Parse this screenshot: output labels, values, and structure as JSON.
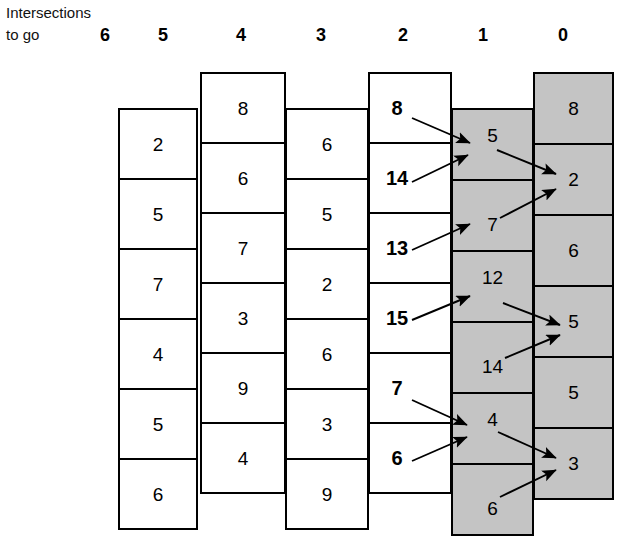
{
  "header": {
    "line1": "Intersections",
    "line2": "to go",
    "columns": [
      {
        "label": "6",
        "x": 92
      },
      {
        "label": "5",
        "x": 150
      },
      {
        "label": "4",
        "x": 228
      },
      {
        "label": "3",
        "x": 308
      },
      {
        "label": "2",
        "x": 390
      },
      {
        "label": "1",
        "x": 470
      },
      {
        "label": "0",
        "x": 550
      }
    ]
  },
  "diagram": {
    "gray": "#c4c4c4",
    "stroke": "#000000",
    "columns": [
      {
        "name": "column-5",
        "left": 118,
        "width": 80,
        "top": 108,
        "cell_height": 70,
        "shaded": false,
        "bold": false,
        "values": [
          "2",
          "5",
          "7",
          "4",
          "5",
          "6"
        ]
      },
      {
        "name": "column-4",
        "left": 200,
        "width": 86,
        "top": 72,
        "cell_height": 70,
        "shaded": false,
        "bold": false,
        "values": [
          "8",
          "6",
          "7",
          "3",
          "9",
          "4"
        ]
      },
      {
        "name": "column-3",
        "left": 285,
        "width": 84,
        "top": 108,
        "cell_height": 70,
        "shaded": false,
        "bold": false,
        "values": [
          "6",
          "5",
          "2",
          "6",
          "3",
          "9"
        ]
      },
      {
        "name": "column-2",
        "left": 368,
        "width": 84,
        "top": 72,
        "cell_height": 70,
        "shaded": false,
        "bold": true,
        "values": [
          "8",
          "14",
          "13",
          "15",
          "7",
          "6"
        ]
      },
      {
        "name": "column-1",
        "left": 451,
        "width": 83,
        "top": 108,
        "cell_height": 71,
        "shaded": true,
        "bold": false,
        "values": [
          "5",
          "7",
          "12",
          "14",
          "4",
          "6"
        ]
      },
      {
        "name": "column-0",
        "left": 533,
        "width": 81,
        "top": 72,
        "cell_height": 71,
        "shaded": true,
        "bold": false,
        "values": [
          "8",
          "2",
          "6",
          "5",
          "5",
          "3"
        ]
      }
    ],
    "arrows": [
      {
        "name": "arrow-8-to-5",
        "from": "8",
        "to": "5",
        "x1": 412,
        "y1": 118,
        "x2": 470,
        "y2": 143
      },
      {
        "name": "arrow-14-to-5",
        "from": "14",
        "to": "5",
        "x1": 412,
        "y1": 182,
        "x2": 468,
        "y2": 155
      },
      {
        "name": "arrow-5-to-2",
        "from": "5",
        "to": "2",
        "x1": 497,
        "y1": 150,
        "x2": 556,
        "y2": 174
      },
      {
        "name": "arrow-7-to-2",
        "from": "7",
        "to": "2",
        "x1": 500,
        "y1": 218,
        "x2": 556,
        "y2": 189
      },
      {
        "name": "arrow-13-to-7",
        "from": "13",
        "to": "7",
        "x1": 412,
        "y1": 250,
        "x2": 470,
        "y2": 224
      },
      {
        "name": "arrow-15-to-12",
        "from": "15",
        "to": "12",
        "x1": 412,
        "y1": 320,
        "x2": 470,
        "y2": 296
      },
      {
        "name": "arrow-12-to-5",
        "from": "12",
        "to": "5",
        "x1": 503,
        "y1": 303,
        "x2": 560,
        "y2": 325
      },
      {
        "name": "arrow-14-to-5",
        "from": "14",
        "to": "5",
        "x1": 505,
        "y1": 358,
        "x2": 560,
        "y2": 335
      },
      {
        "name": "arrow-7-to-4",
        "from": "7",
        "to": "4",
        "x1": 412,
        "y1": 400,
        "x2": 467,
        "y2": 425
      },
      {
        "name": "arrow-6-to-4",
        "from": "6",
        "to": "4",
        "x1": 412,
        "y1": 461,
        "x2": 467,
        "y2": 437
      },
      {
        "name": "arrow-4-to-3",
        "from": "4",
        "to": "3",
        "x1": 498,
        "y1": 432,
        "x2": 556,
        "y2": 458
      },
      {
        "name": "arrow-6-to-3",
        "from": "6",
        "to": "3",
        "x1": 500,
        "y1": 497,
        "x2": 556,
        "y2": 470
      }
    ]
  }
}
